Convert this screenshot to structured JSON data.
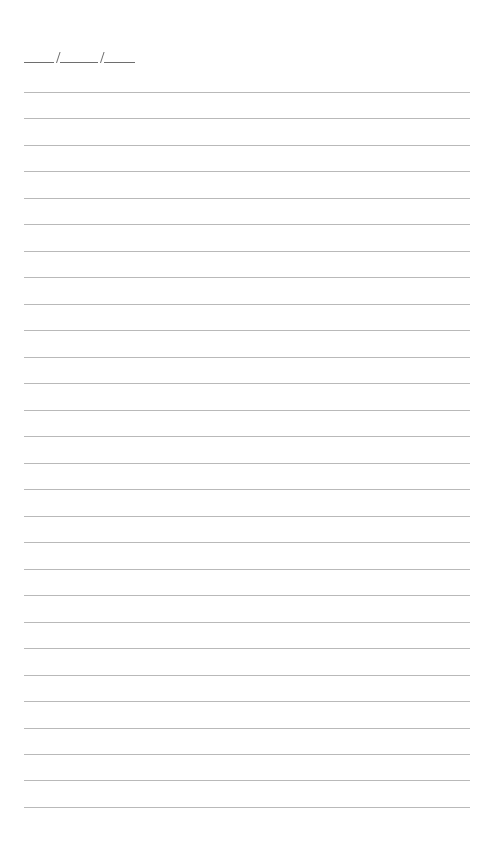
{
  "page": {
    "type": "lined notebook page",
    "background": "#ffffff",
    "line_color": "#b9b9b9",
    "line_count": 28,
    "first_line_y": 92,
    "line_spacing": 26.48,
    "line_left": 24,
    "line_width": 446
  },
  "date_field": {
    "format": "____/_____/____",
    "segments": [
      {
        "name": "month",
        "left": 24,
        "width": 30
      },
      {
        "name": "day",
        "left": 60,
        "width": 38
      },
      {
        "name": "year",
        "left": 104,
        "width": 31
      }
    ],
    "slashes": [
      56,
      100
    ],
    "value": ""
  }
}
